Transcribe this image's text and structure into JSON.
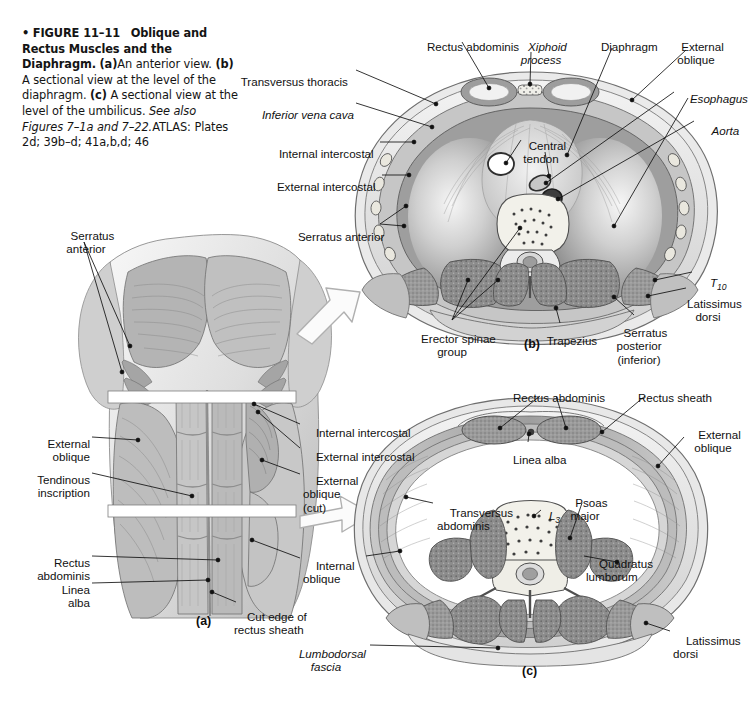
{
  "figure": {
    "number": "FIGURE 11–11",
    "title": "Oblique and Rectus Muscles and the Diaphragm.",
    "caption_a": "An anterior view.",
    "caption_b": "A sectional view at the level of the diaphragm.",
    "caption_c": "A sectional view at the level of the umbilicus.",
    "see_also": "See also Figures 7–1a and 7–22.",
    "atlas": "ATLAS: Plates 2d; 39b–d; 41a,b,d; 46",
    "marker_a": "(a)",
    "marker_b": "(b)",
    "marker_c": "(c)",
    "bullet": "•"
  },
  "panel_a": {
    "letter": "(a)",
    "labels": [
      {
        "id": "serratus-anterior",
        "text": "Serratus\nanterior",
        "x": 52,
        "y": 222,
        "align": "left",
        "italic": false
      },
      {
        "id": "external-oblique",
        "text": "External\noblique",
        "x": 18,
        "y": 430,
        "align": "right",
        "italic": false,
        "w": 72
      },
      {
        "id": "tendinous-inscription",
        "text": "Tendinous\ninscription",
        "x": 8,
        "y": 466,
        "align": "right",
        "italic": false,
        "w": 82
      },
      {
        "id": "rectus-abdominis",
        "text": "Rectus\nabdominis",
        "x": 8,
        "y": 549,
        "align": "right",
        "italic": false,
        "w": 82
      },
      {
        "id": "linea-alba",
        "text": "Linea\nalba",
        "x": 18,
        "y": 576,
        "align": "right",
        "italic": false,
        "w": 72
      },
      {
        "id": "internal-intercostal",
        "text": "Internal intercostal",
        "x": 303,
        "y": 419,
        "align": "left",
        "italic": false
      },
      {
        "id": "external-intercostal",
        "text": "External intercostal",
        "x": 303,
        "y": 443,
        "align": "left",
        "italic": false
      },
      {
        "id": "external-oblique-cut",
        "text": "External\noblique\n(cut)",
        "x": 303,
        "y": 467,
        "align": "left",
        "italic": false
      },
      {
        "id": "internal-oblique",
        "text": "Internal\noblique",
        "x": 303,
        "y": 552,
        "align": "left",
        "italic": false
      },
      {
        "id": "cut-edge-rectus-sheath",
        "text": "Cut edge of\nrectus sheath",
        "x": 238,
        "y": 597,
        "align": "left",
        "italic": false
      }
    ]
  },
  "panel_b": {
    "letter": "(b)",
    "labels": [
      {
        "id": "rectus-abdominis",
        "text": "Rectus abdominis",
        "x": 414,
        "y": 31,
        "align": "left",
        "italic": false
      },
      {
        "id": "xiphoid-process",
        "text": "Xiphoid\nprocess",
        "x": 524,
        "y": 29,
        "align": "left",
        "italic": true
      },
      {
        "id": "diaphragm",
        "text": "Diaphragm",
        "x": 588,
        "y": 31,
        "align": "left",
        "italic": false
      },
      {
        "id": "external-oblique",
        "text": "External\noblique",
        "x": 672,
        "y": 29,
        "align": "left",
        "italic": false
      },
      {
        "id": "esophagus",
        "text": "Esophagus",
        "x": 677,
        "y": 83,
        "align": "left",
        "italic": true
      },
      {
        "id": "aorta",
        "text": "Aorta",
        "x": 696,
        "y": 115,
        "align": "left",
        "italic": true
      },
      {
        "id": "transversus-thoracis",
        "text": "Transversus thoracis",
        "x": 232,
        "y": 66,
        "align": "left",
        "italic": false
      },
      {
        "id": "inferior-vena-cava",
        "text": "Inferior vena cava",
        "x": 253,
        "y": 99,
        "align": "left",
        "italic": true
      },
      {
        "id": "internal-intercostal",
        "text": "Internal intercostal",
        "x": 268,
        "y": 138,
        "align": "left",
        "italic": false
      },
      {
        "id": "external-intercostal",
        "text": "External intercostal",
        "x": 267,
        "y": 171,
        "align": "left",
        "italic": false
      },
      {
        "id": "serratus-anterior",
        "text": "Serratus anterior",
        "x": 287,
        "y": 220,
        "align": "left",
        "italic": false
      },
      {
        "id": "central-tendon",
        "text": "Central\ntendon",
        "x": 524,
        "y": 131,
        "align": "left",
        "italic": false
      },
      {
        "id": "t10",
        "text": "T",
        "sub": "10",
        "x": 694,
        "y": 268,
        "align": "left",
        "italic": true
      },
      {
        "id": "latissimus-dorsi",
        "text": "Latissimus\ndorsi",
        "x": 678,
        "y": 288,
        "align": "left",
        "italic": false
      },
      {
        "id": "serratus-posterior",
        "text": "Serratus\nposterior\n(inferior)",
        "x": 608,
        "y": 317,
        "align": "left",
        "italic": false
      },
      {
        "id": "trapezius",
        "text": "Trapezius",
        "x": 537,
        "y": 325,
        "align": "left",
        "italic": false
      },
      {
        "id": "erector-spinae-group",
        "text": "Erector spinae\ngroup",
        "x": 414,
        "y": 323,
        "align": "left",
        "italic": false
      }
    ]
  },
  "panel_c": {
    "letter": "(c)",
    "labels": [
      {
        "id": "rectus-abdominis",
        "text": "Rectus abdominis",
        "x": 502,
        "y": 382,
        "align": "left",
        "italic": false
      },
      {
        "id": "rectus-sheath",
        "text": "Rectus sheath",
        "x": 628,
        "y": 382,
        "align": "left",
        "italic": false
      },
      {
        "id": "external-oblique",
        "text": "External\noblique",
        "x": 686,
        "y": 419,
        "align": "left",
        "italic": false
      },
      {
        "id": "linea-alba",
        "text": "Linea alba",
        "x": 502,
        "y": 444,
        "align": "left",
        "italic": false
      },
      {
        "id": "transversus-abdominis",
        "text": "Transversus\nabdominis",
        "x": 437,
        "y": 497,
        "align": "left",
        "italic": false
      },
      {
        "id": "l3",
        "text": "L",
        "sub": "3",
        "x": 537,
        "y": 500,
        "align": "left",
        "italic": true
      },
      {
        "id": "psoas-major",
        "text": "Psoas\nmajor",
        "x": 562,
        "y": 487,
        "align": "left",
        "italic": false
      },
      {
        "id": "quadratus-lumborum",
        "text": "Quadratus\nlumborum",
        "x": 586,
        "y": 548,
        "align": "left",
        "italic": false
      },
      {
        "id": "latissimus-dorsi",
        "text": "Latissimus\ndorsi",
        "x": 673,
        "y": 625,
        "align": "left",
        "italic": false
      },
      {
        "id": "lumbodorsal-fascia",
        "text": "Lumbodorsal\nfascia",
        "x": 368,
        "y": 638,
        "align": "right",
        "italic": true,
        "w": 0
      }
    ]
  },
  "colors": {
    "background": "#ffffff",
    "text": "#111111",
    "leader": "#111111",
    "muscle_mid": "#a8a8a8",
    "muscle_dark": "#6f6f6f",
    "muscle_light": "#d6d6d6",
    "fascia": "#ececec",
    "arrow_outline": "#b5b5b5"
  }
}
